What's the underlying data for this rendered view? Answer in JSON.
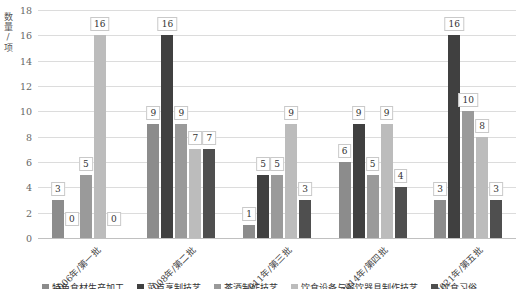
{
  "chart_data": {
    "type": "bar",
    "title": "",
    "xlabel": "",
    "ylabel": "数量/项",
    "ylim": [
      0,
      18
    ],
    "yticks": [
      0,
      2,
      4,
      6,
      8,
      10,
      12,
      14,
      16,
      18
    ],
    "grid": true,
    "legend_position": "bottom",
    "data_labels": true,
    "categories": [
      "2006年/第一批",
      "2008年/第二批",
      "2011年/第三批",
      "2014年/第四批",
      "2021年/第五批"
    ],
    "series": [
      {
        "name": "特色食材生产加工",
        "color": "#8c8c8c",
        "values": [
          3,
          9,
          1,
          6,
          3
        ]
      },
      {
        "name": "菜点烹制技艺",
        "color": "#404040",
        "values": [
          0,
          16,
          5,
          9,
          16
        ]
      },
      {
        "name": "茶酒制作技艺",
        "color": "#9a9a9a",
        "values": [
          5,
          9,
          5,
          5,
          10
        ]
      },
      {
        "name": "饮食设备与餐饮器具制作技艺",
        "color": "#bcbcbc",
        "values": [
          16,
          7,
          9,
          9,
          8
        ]
      },
      {
        "name": "饮食习俗",
        "color": "#4f4f4f",
        "values": [
          0,
          7,
          3,
          4,
          3
        ]
      }
    ],
    "colors": {
      "background": "#ffffff",
      "gridline": "#dcdcdc",
      "axis_line": "#c0c0c0",
      "tick_text": "#666666",
      "label_box_border": "#c9c9c9"
    }
  }
}
